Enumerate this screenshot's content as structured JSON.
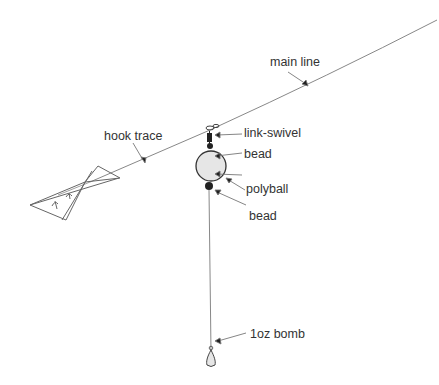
{
  "diagram": {
    "type": "fishing-rig",
    "colors": {
      "line": "#777777",
      "ink": "#222222",
      "ball_fill": "#e6e6e6",
      "text": "#333333"
    },
    "labels": {
      "main_line": "main line",
      "hook_trace": "hook trace",
      "link_swivel": "link-swivel",
      "bead_top": "bead",
      "polyball": "polyball",
      "bead_bottom": "bead",
      "bomb": "1oz bomb"
    }
  }
}
